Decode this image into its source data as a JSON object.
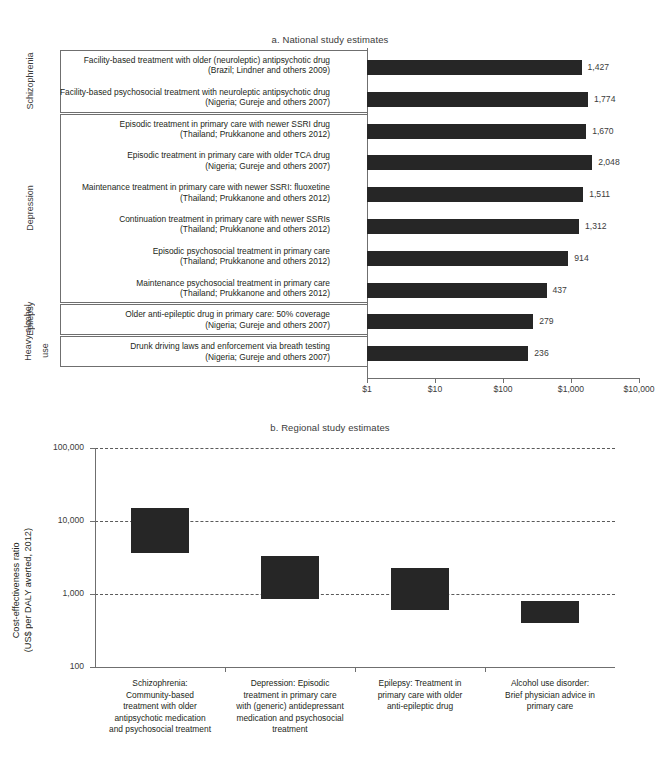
{
  "panel_a": {
    "title": "a. National study estimates",
    "axis": {
      "ticks": [
        "$1",
        "$10",
        "$100",
        "$1,000",
        "$10,000"
      ],
      "tick_values": [
        1,
        10,
        100,
        1000,
        10000
      ]
    },
    "groups": [
      {
        "name": "Schizophrenia",
        "count": 2
      },
      {
        "name": "Depression",
        "count": 6
      },
      {
        "name": "Epilepsy",
        "count": 1
      },
      {
        "name": "Heavy alcohol use",
        "count": 1
      }
    ],
    "group_labels": {
      "schizophrenia": "Schizophrenia",
      "depression": "Depression",
      "epilepsy": "Epilepsy",
      "heavy": "Heavy",
      "alcohol": "alcohol",
      "use": "use"
    },
    "rows": [
      {
        "line1": "Facility-based treatment with older (neuroleptic) antipsychotic drug",
        "line2": "(Brazil; Lindner and others 2009)",
        "value": 1427,
        "value_label": "1,427"
      },
      {
        "line1": "Facility-based psychosocial treatment with neuroleptic antipsychotic drug",
        "line2": "(Nigeria; Gureje and others 2007)",
        "value": 1774,
        "value_label": "1,774"
      },
      {
        "line1": "Episodic treatment in primary care with newer SSRI drug",
        "line2": "(Thailand; Prukkanone and others 2012)",
        "value": 1670,
        "value_label": "1,670"
      },
      {
        "line1": "Episodic treatment in primary care with older TCA drug",
        "line2": "(Nigeria; Gureje and others 2007)",
        "value": 2048,
        "value_label": "2,048"
      },
      {
        "line1": "Maintenance treatment in primary care with newer SSRI: fluoxetine",
        "line2": "(Thailand; Prukkanone and others 2012)",
        "value": 1511,
        "value_label": "1,511"
      },
      {
        "line1": "Continuation treatment in primary care with newer SSRIs",
        "line2": "(Thailand; Prukkanone and others 2012)",
        "value": 1312,
        "value_label": "1,312"
      },
      {
        "line1": "Episodic psychosocial treatment in primary care",
        "line2": "(Thailand; Prukkanone and others 2012)",
        "value": 914,
        "value_label": "914"
      },
      {
        "line1": "Maintenance psychosocial treatment in primary care",
        "line2": "(Thailand; Prukkanone and others 2012)",
        "value": 437,
        "value_label": "437"
      },
      {
        "line1": "Older anti-epileptic drug in primary care: 50% coverage",
        "line2": "(Nigeria; Gureje and others 2007)",
        "value": 279,
        "value_label": "279"
      },
      {
        "line1": "Drunk driving laws and enforcement via breath testing",
        "line2": "(Nigeria; Gureje and others 2007)",
        "value": 236,
        "value_label": "236"
      }
    ]
  },
  "panel_b": {
    "title": "b. Regional study estimates",
    "ylabel_line1": "Cost-effectiveness ratio",
    "ylabel_line2": "(US$ per DALY averted, 2012)",
    "y_ticks": [
      "100,000",
      "10,000",
      "1,000",
      "100"
    ],
    "y_tick_values": [
      100000,
      10000,
      1000,
      100
    ],
    "categories": [
      {
        "lines": [
          "Schizophrenia:",
          "Community-based",
          "treatment with older",
          "antipsychotic medication",
          "and psychosocial treatment"
        ]
      },
      {
        "lines": [
          "Depression: Episodic",
          "treatment in primary care",
          "with (generic) antidepressant",
          "medication and psychosocial",
          "treatment"
        ]
      },
      {
        "lines": [
          "Epilepsy: Treatment in",
          "primary care with older",
          "anti-epileptic drug"
        ]
      },
      {
        "lines": [
          "Alcohol use disorder:",
          "Brief physician advice in",
          "primary care"
        ]
      }
    ]
  },
  "chart_data": [
    {
      "type": "bar",
      "orientation": "horizontal",
      "title": "a. National study estimates",
      "xlabel": "",
      "ylabel": "",
      "xscale": "log",
      "xlim": [
        1,
        10000
      ],
      "xticks": [
        1,
        10,
        100,
        1000,
        10000
      ],
      "xticklabels": [
        "$1",
        "$10",
        "$100",
        "$1,000",
        "$10,000"
      ],
      "grid": false,
      "legend": "none",
      "bar_color": "#262626",
      "categories": [
        "Facility-based treatment with older (neuroleptic) antipsychotic drug (Brazil; Lindner and others 2009)",
        "Facility-based psychosocial treatment with neuroleptic antipsychotic drug (Nigeria; Gureje and others 2007)",
        "Episodic treatment in primary care with newer SSRI drug (Thailand; Prukkanone and others 2012)",
        "Episodic treatment in primary care with older TCA drug (Nigeria; Gureje and others 2007)",
        "Maintenance treatment in primary care with newer SSRI: fluoxetine (Thailand; Prukkanone and others 2012)",
        "Continuation treatment in primary care with newer SSRIs (Thailand; Prukkanone and others 2012)",
        "Episodic psychosocial treatment in primary care (Thailand; Prukkanone and others 2012)",
        "Maintenance psychosocial treatment in primary care (Thailand; Prukkanone and others 2012)",
        "Older anti-epileptic drug in primary care: 50% coverage (Nigeria; Gureje and others 2007)",
        "Drunk driving laws and enforcement via breath testing (Nigeria; Gureje and others 2007)"
      ],
      "values": [
        1427,
        1774,
        1670,
        2048,
        1511,
        1312,
        914,
        437,
        279,
        236
      ],
      "data_labels": [
        "1,427",
        "1,774",
        "1,670",
        "2,048",
        "1,511",
        "1,312",
        "914",
        "437",
        "279",
        "236"
      ],
      "groups": [
        "Schizophrenia",
        "Schizophrenia",
        "Depression",
        "Depression",
        "Depression",
        "Depression",
        "Depression",
        "Depression",
        "Epilepsy",
        "Heavy alcohol use"
      ]
    },
    {
      "type": "bar",
      "subtype": "range",
      "title": "b. Regional study estimates",
      "xlabel": "",
      "ylabel": "Cost-effectiveness ratio (US$ per DALY averted, 2012)",
      "yscale": "log",
      "ylim": [
        100,
        100000
      ],
      "yticks": [
        100,
        1000,
        10000,
        100000
      ],
      "yticklabels": [
        "100",
        "1,000",
        "10,000",
        "100,000"
      ],
      "grid": true,
      "gridstyle": "dashed-horizontal",
      "legend": "none",
      "bar_color": "#262626",
      "categories": [
        "Schizophrenia: Community-based treatment with older antipsychotic medication and psychosocial treatment",
        "Depression: Episodic treatment in primary care with (generic) antidepressant medication and psychosocial treatment",
        "Epilepsy: Treatment in primary care with older anti-epileptic drug",
        "Alcohol use disorder: Brief physician advice in primary care"
      ],
      "ranges": [
        {
          "low": 3600,
          "high": 15000
        },
        {
          "low": 850,
          "high": 3300
        },
        {
          "low": 600,
          "high": 2300
        },
        {
          "low": 400,
          "high": 800
        }
      ]
    }
  ]
}
